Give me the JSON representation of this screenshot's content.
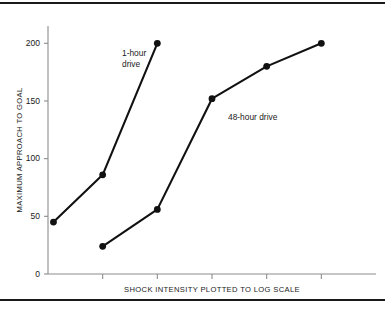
{
  "chart_data": {
    "type": "line",
    "title": "",
    "xlabel": "SHOCK INTENSITY PLOTTED TO LOG SCALE",
    "ylabel": "MAXIMUM APPROACH TO GOAL",
    "ylim": [
      0,
      215
    ],
    "yticks": [
      0,
      50,
      100,
      150,
      200
    ],
    "ytick_labels": [
      "0",
      "50",
      "100",
      "150",
      "200"
    ],
    "xticks": [
      1,
      2,
      3,
      4,
      5
    ],
    "xtick_labels": [
      "",
      "",
      "",
      "",
      ""
    ],
    "xlim": [
      0,
      6
    ],
    "grid": false,
    "legend_position": "inline-annotation",
    "series": [
      {
        "name": "1-hour drive",
        "annotation": "1-hour drive",
        "annotation_line1": "1-hour",
        "annotation_line2": "drive",
        "x": [
          0.1,
          1,
          2
        ],
        "values": [
          45,
          86,
          200
        ]
      },
      {
        "name": "48-hour drive",
        "annotation": "48-hour drive",
        "annotation_line1": "48-hour drive",
        "annotation_line2": "",
        "x": [
          1,
          2,
          3,
          4,
          5
        ],
        "values": [
          24,
          56,
          152,
          180,
          200
        ]
      }
    ],
    "colors": {
      "line": "#111111",
      "marker": "#111111",
      "axis": "#8c8c8c",
      "text": "#1a1a1a",
      "frame": "#1a1a1a",
      "background": "#ffffff"
    }
  }
}
